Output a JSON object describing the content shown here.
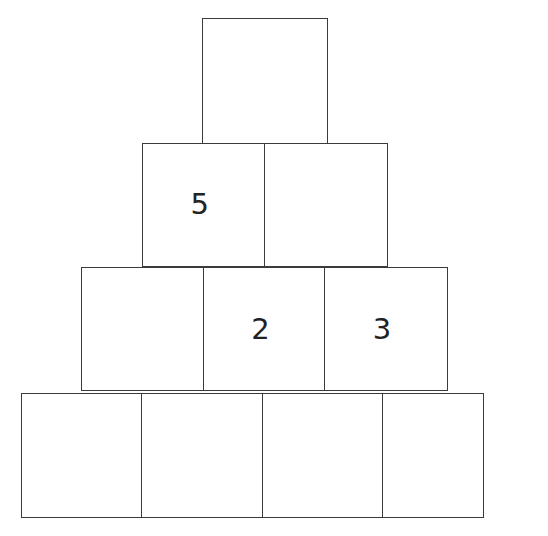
{
  "figure": {
    "name": "number-pyramid",
    "background_color": "#ffffff",
    "line_color": "#3b3b3b",
    "text_color": "#222222"
  },
  "chart_data": {
    "type": "table",
    "title": "",
    "rows": [
      {
        "level": 1,
        "cells": [
          ""
        ]
      },
      {
        "level": 2,
        "cells": [
          "5",
          ""
        ]
      },
      {
        "level": 3,
        "cells": [
          "",
          "2",
          "3"
        ]
      },
      {
        "level": 4,
        "cells": [
          "",
          "",
          "",
          ""
        ]
      }
    ],
    "filled_values": [
      "5",
      "2",
      "3"
    ],
    "row_cell_counts": [
      1,
      2,
      3,
      4
    ]
  }
}
